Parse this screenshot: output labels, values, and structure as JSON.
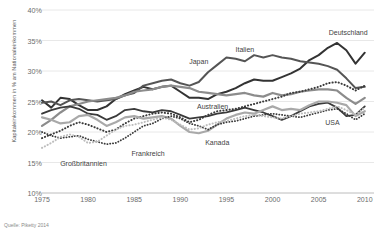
{
  "chart_data": {
    "type": "line",
    "title": "",
    "xlabel": "",
    "ylabel": "Kapitaleinkommen in % am Nationaleinkommen",
    "xlim": [
      1975,
      2011
    ],
    "ylim": [
      10,
      40
    ],
    "grid": true,
    "legend_position": "inline-annotations",
    "yticks": [
      "10%",
      "15%",
      "20%",
      "25%",
      "30%",
      "35%",
      "40%"
    ],
    "ytick_values": [
      10,
      15,
      20,
      25,
      30,
      35,
      40
    ],
    "xticks": [
      "1975",
      "1980",
      "1985",
      "1990",
      "1995",
      "2000",
      "2005",
      "2010"
    ],
    "xtick_values": [
      1975,
      1980,
      1985,
      1990,
      1995,
      2000,
      2005,
      2010
    ],
    "x": [
      1975,
      1976,
      1977,
      1978,
      1979,
      1980,
      1981,
      1982,
      1983,
      1984,
      1985,
      1986,
      1987,
      1988,
      1989,
      1990,
      1991,
      1992,
      1993,
      1994,
      1995,
      1996,
      1997,
      1998,
      1999,
      2000,
      2001,
      2002,
      2003,
      2004,
      2005,
      2006,
      2007,
      2008,
      2009,
      2010
    ],
    "series": [
      {
        "name": "Deutschland",
        "style": "solid",
        "color": "#333333",
        "width": 2.0,
        "label_x": 2008.2,
        "label_y": 36.4,
        "values": [
          25.2,
          24.0,
          25.6,
          25.4,
          24.4,
          23.6,
          23.6,
          24.2,
          25.4,
          26.2,
          26.8,
          27.4,
          27.0,
          27.4,
          27.6,
          26.6,
          25.6,
          25.6,
          25.4,
          26.2,
          26.6,
          27.2,
          28.0,
          28.6,
          28.4,
          28.4,
          29.0,
          29.6,
          30.4,
          31.8,
          32.6,
          33.8,
          34.6,
          33.4,
          31.2,
          33.0
        ]
      },
      {
        "name": "Italien",
        "style": "solid",
        "color": "#555555",
        "width": 2.0,
        "label_x": 1997.0,
        "label_y": 33.6,
        "values": [
          24.8,
          25.0,
          24.4,
          25.2,
          25.4,
          25.2,
          25.0,
          25.2,
          25.4,
          26.0,
          26.4,
          27.6,
          28.0,
          28.4,
          28.6,
          28.0,
          27.6,
          28.2,
          29.8,
          31.0,
          32.2,
          32.0,
          31.6,
          32.6,
          32.2,
          32.6,
          32.2,
          32.0,
          31.6,
          31.4,
          31.2,
          30.8,
          30.2,
          28.8,
          27.2,
          27.4
        ]
      },
      {
        "name": "Japan",
        "style": "solid",
        "color": "#8c8c8c",
        "width": 2.2,
        "label_x": 1992.0,
        "label_y": 31.6,
        "values": [
          21.0,
          22.0,
          23.2,
          24.2,
          24.6,
          25.0,
          25.2,
          25.4,
          25.6,
          26.0,
          26.6,
          26.8,
          27.0,
          27.4,
          27.6,
          27.4,
          27.2,
          26.6,
          26.4,
          26.2,
          26.0,
          26.2,
          26.4,
          26.0,
          25.8,
          26.4,
          26.0,
          26.2,
          26.6,
          26.8,
          27.0,
          27.0,
          26.8,
          25.6,
          24.6,
          25.6
        ]
      },
      {
        "name": "Australien",
        "style": "dotted",
        "color": "#3a3a3a",
        "width": 2.0,
        "label_x": 1993.5,
        "label_y": 24.2,
        "values": [
          19.0,
          19.6,
          20.2,
          21.0,
          21.6,
          21.2,
          20.6,
          20.0,
          20.4,
          21.4,
          22.2,
          22.6,
          23.0,
          23.2,
          23.0,
          22.4,
          21.6,
          22.0,
          22.8,
          23.4,
          23.6,
          23.8,
          24.2,
          24.6,
          25.0,
          25.4,
          25.8,
          26.4,
          26.6,
          27.0,
          27.4,
          28.0,
          28.2,
          27.6,
          26.8,
          27.6
        ]
      },
      {
        "name": "USA",
        "style": "solid",
        "color": "#3a3a3a",
        "width": 1.8,
        "label_x": 2006.5,
        "label_y": 21.6,
        "values": [
          23.0,
          23.6,
          24.0,
          24.2,
          23.8,
          23.0,
          22.8,
          22.0,
          22.6,
          23.6,
          23.8,
          23.4,
          23.2,
          23.6,
          23.4,
          22.8,
          22.2,
          22.4,
          22.6,
          23.0,
          23.2,
          23.6,
          24.0,
          23.6,
          23.2,
          22.6,
          22.0,
          22.6,
          23.4,
          24.2,
          24.6,
          24.8,
          24.0,
          22.6,
          22.8,
          24.2
        ]
      },
      {
        "name": "Kanada",
        "style": "solid",
        "color": "#a9a9a9",
        "width": 2.2,
        "label_x": 1994.0,
        "label_y": 18.4,
        "values": [
          22.4,
          22.0,
          21.4,
          21.6,
          22.6,
          22.8,
          22.0,
          21.0,
          21.6,
          22.4,
          22.6,
          22.2,
          22.4,
          22.6,
          22.2,
          21.0,
          20.0,
          19.8,
          20.2,
          21.2,
          22.2,
          22.8,
          23.2,
          23.0,
          23.6,
          24.2,
          23.6,
          23.8,
          23.6,
          24.4,
          25.0,
          25.0,
          24.8,
          24.4,
          22.6,
          23.4
        ]
      },
      {
        "name": "Frankreich",
        "style": "dotted",
        "color": "#3a3a3a",
        "width": 1.8,
        "label_x": 1986.5,
        "label_y": 16.6,
        "values": [
          20.0,
          19.4,
          19.0,
          19.2,
          19.4,
          18.8,
          18.4,
          18.0,
          18.2,
          19.0,
          20.0,
          21.0,
          21.4,
          22.2,
          22.6,
          22.2,
          21.4,
          21.0,
          20.4,
          21.2,
          21.6,
          21.8,
          22.2,
          22.6,
          22.8,
          23.0,
          22.8,
          22.6,
          22.4,
          22.8,
          23.2,
          23.6,
          23.8,
          23.0,
          22.0,
          23.0
        ]
      },
      {
        "name": "Großbritannien",
        "style": "dotted",
        "color": "#bdbdbd",
        "width": 2.0,
        "label_x": 1979.5,
        "label_y": 15.0,
        "values": [
          17.4,
          18.2,
          19.2,
          19.6,
          19.2,
          18.2,
          18.4,
          19.4,
          20.4,
          21.0,
          21.2,
          21.6,
          22.0,
          22.4,
          22.0,
          21.2,
          20.4,
          20.6,
          21.2,
          21.6,
          21.8,
          22.2,
          22.6,
          22.8,
          22.6,
          22.4,
          22.2,
          22.6,
          23.0,
          23.2,
          23.4,
          23.8,
          24.2,
          23.6,
          22.8,
          24.0
        ]
      }
    ],
    "caption": "Quelle: Piketty 2014"
  },
  "plot": {
    "left": 42,
    "top": 10,
    "right": 374,
    "bottom": 193,
    "grid_color": "#e2e2e2",
    "axis_color": "#bcbcbc"
  }
}
